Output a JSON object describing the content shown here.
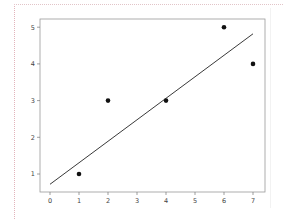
{
  "chart_data": {
    "type": "scatter",
    "title": "",
    "xlabel": "",
    "ylabel": "",
    "xlim": [
      -0.35,
      7.35
    ],
    "ylim": [
      0.5,
      5.2
    ],
    "grid": false,
    "legend": null,
    "x_ticks": [
      "0",
      "1",
      "2",
      "3",
      "4",
      "5",
      "6",
      "7"
    ],
    "y_ticks": [
      "1",
      "2",
      "3",
      "4",
      "5"
    ],
    "series": [
      {
        "name": "points",
        "type": "scatter",
        "x": [
          1,
          2,
          4,
          6,
          7
        ],
        "y": [
          1,
          3,
          3,
          5,
          4
        ],
        "color": "#111111"
      },
      {
        "name": "fit-line",
        "type": "line",
        "x": [
          0,
          7
        ],
        "y": [
          0.72,
          4.82
        ],
        "color": "#222222"
      }
    ]
  },
  "axes": {
    "frame_color": "#999999",
    "tick_color": "#444444"
  }
}
